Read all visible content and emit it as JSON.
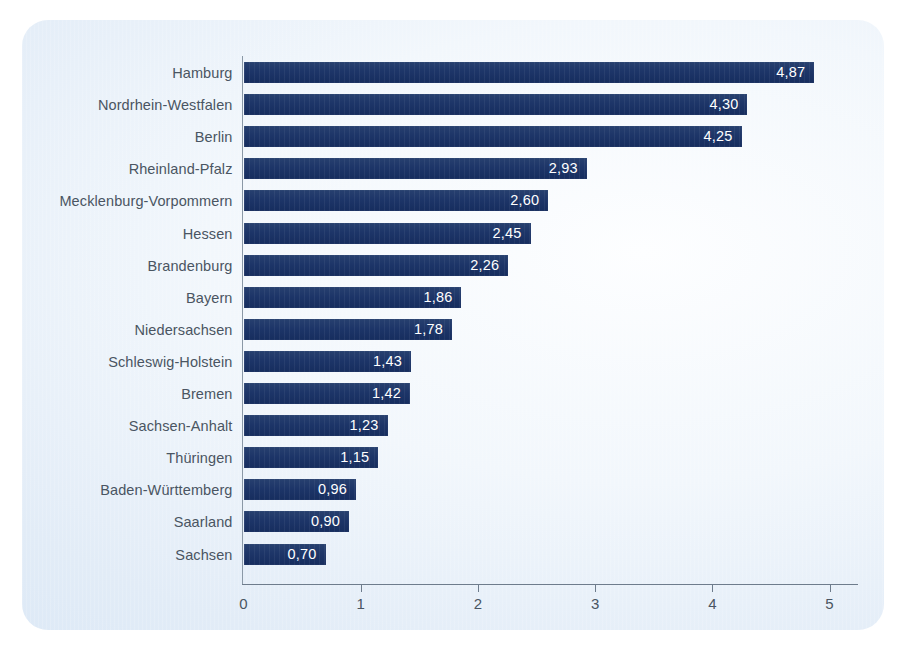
{
  "chart_data": {
    "type": "bar",
    "orientation": "horizontal",
    "title": "",
    "subtitle": "",
    "xlabel": "",
    "ylabel": "",
    "xlim": [
      0,
      5
    ],
    "xticks": [
      "0",
      "1",
      "2",
      "3",
      "4",
      "5"
    ],
    "grid": false,
    "legend": null,
    "decimal_separator": ",",
    "bar_color": "#1d3568",
    "value_label_color": "#ffffff",
    "category_label_color": "#4a5562",
    "axis_color": "#6e7c8c",
    "panel_background": "#e8f1fa",
    "categories": [
      "Hamburg",
      "Nordrhein-Westfalen",
      "Berlin",
      "Rheinland-Pfalz",
      "Mecklenburg-Vorpommern",
      "Hessen",
      "Brandenburg",
      "Bayern",
      "Niedersachsen",
      "Schleswig-Holstein",
      "Bremen",
      "Sachsen-Anhalt",
      "Thüringen",
      "Baden-Württemberg",
      "Saarland",
      "Sachsen"
    ],
    "values": [
      4.87,
      4.3,
      4.25,
      2.93,
      2.6,
      2.45,
      2.26,
      1.86,
      1.78,
      1.43,
      1.42,
      1.23,
      1.15,
      0.96,
      0.9,
      0.7
    ],
    "value_labels": [
      "4,87",
      "4,30",
      "4,25",
      "2,93",
      "2,60",
      "2,45",
      "2,26",
      "1,86",
      "1,78",
      "1,43",
      "1,42",
      "1,23",
      "1,15",
      "0,96",
      "0,90",
      "0,70"
    ]
  }
}
